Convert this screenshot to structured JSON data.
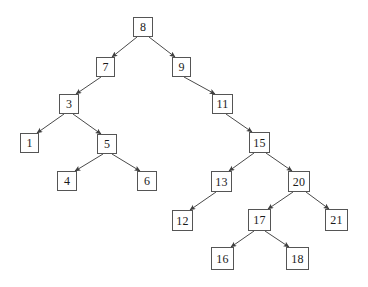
{
  "figure": {
    "type": "diagram",
    "background_color": "#ffffff",
    "node_border_color": "#555555",
    "node_fill_color": "#ffffff",
    "edge_color": "#4a4a4a",
    "text_color": "#1a1a1a"
  },
  "tree": {
    "root": "8",
    "node_count": 17,
    "nodes": [
      {
        "id": "n8",
        "label": "8",
        "x": 133,
        "y": 17,
        "w": 20,
        "h": 20,
        "level": 0
      },
      {
        "id": "n7",
        "label": "7",
        "x": 96,
        "y": 57,
        "w": 19,
        "h": 20,
        "level": 1
      },
      {
        "id": "n9",
        "label": "9",
        "x": 172,
        "y": 57,
        "w": 19,
        "h": 20,
        "level": 1
      },
      {
        "id": "n3",
        "label": "3",
        "x": 59,
        "y": 94,
        "w": 20,
        "h": 20,
        "level": 2
      },
      {
        "id": "n11",
        "label": "11",
        "x": 212,
        "y": 94,
        "w": 21,
        "h": 20,
        "level": 2
      },
      {
        "id": "n1",
        "label": "1",
        "x": 20,
        "y": 133,
        "w": 19,
        "h": 20,
        "level": 3
      },
      {
        "id": "n5",
        "label": "5",
        "x": 97,
        "y": 134,
        "w": 20,
        "h": 20,
        "level": 3
      },
      {
        "id": "n15",
        "label": "15",
        "x": 249,
        "y": 132,
        "w": 21,
        "h": 21,
        "level": 3
      },
      {
        "id": "n4",
        "label": "4",
        "x": 57,
        "y": 171,
        "w": 20,
        "h": 20,
        "level": 4
      },
      {
        "id": "n6",
        "label": "6",
        "x": 137,
        "y": 171,
        "w": 20,
        "h": 20,
        "level": 4
      },
      {
        "id": "n13",
        "label": "13",
        "x": 211,
        "y": 171,
        "w": 21,
        "h": 21,
        "level": 4
      },
      {
        "id": "n20",
        "label": "20",
        "x": 288,
        "y": 171,
        "w": 22,
        "h": 21,
        "level": 4
      },
      {
        "id": "n12",
        "label": "12",
        "x": 172,
        "y": 210,
        "w": 21,
        "h": 21,
        "level": 5
      },
      {
        "id": "n17",
        "label": "17",
        "x": 248,
        "y": 209,
        "w": 23,
        "h": 22,
        "level": 5
      },
      {
        "id": "n21",
        "label": "21",
        "x": 325,
        "y": 209,
        "w": 23,
        "h": 22,
        "level": 5
      },
      {
        "id": "n16",
        "label": "16",
        "x": 211,
        "y": 247,
        "w": 23,
        "h": 23,
        "level": 6
      },
      {
        "id": "n18",
        "label": "18",
        "x": 286,
        "y": 247,
        "w": 23,
        "h": 23,
        "level": 6
      }
    ],
    "edges": [
      {
        "from": "n8",
        "to": "n7",
        "side": "left",
        "x1": 137,
        "y1": 37,
        "x2": 112,
        "y2": 57
      },
      {
        "from": "n8",
        "to": "n9",
        "side": "right",
        "x1": 149,
        "y1": 37,
        "x2": 175,
        "y2": 57
      },
      {
        "from": "n7",
        "to": "n3",
        "side": "left",
        "x1": 101,
        "y1": 77,
        "x2": 76,
        "y2": 94
      },
      {
        "from": "n9",
        "to": "n11",
        "side": "right",
        "x1": 184,
        "y1": 77,
        "x2": 215,
        "y2": 94
      },
      {
        "from": "n3",
        "to": "n1",
        "side": "left",
        "x1": 64,
        "y1": 114,
        "x2": 37,
        "y2": 133
      },
      {
        "from": "n3",
        "to": "n5",
        "side": "right",
        "x1": 73,
        "y1": 114,
        "x2": 101,
        "y2": 134
      },
      {
        "from": "n11",
        "to": "n15",
        "side": "right",
        "x1": 226,
        "y1": 114,
        "x2": 252,
        "y2": 132
      },
      {
        "from": "n5",
        "to": "n4",
        "side": "left",
        "x1": 103,
        "y1": 154,
        "x2": 75,
        "y2": 171
      },
      {
        "from": "n5",
        "to": "n6",
        "side": "right",
        "x1": 112,
        "y1": 154,
        "x2": 140,
        "y2": 171
      },
      {
        "from": "n15",
        "to": "n13",
        "side": "left",
        "x1": 254,
        "y1": 153,
        "x2": 229,
        "y2": 171
      },
      {
        "from": "n15",
        "to": "n20",
        "side": "right",
        "x1": 266,
        "y1": 153,
        "x2": 292,
        "y2": 171
      },
      {
        "from": "n13",
        "to": "n12",
        "side": "left",
        "x1": 216,
        "y1": 192,
        "x2": 190,
        "y2": 210
      },
      {
        "from": "n20",
        "to": "n17",
        "side": "left",
        "x1": 293,
        "y1": 192,
        "x2": 268,
        "y2": 209
      },
      {
        "from": "n20",
        "to": "n21",
        "side": "right",
        "x1": 306,
        "y1": 192,
        "x2": 329,
        "y2": 209
      },
      {
        "from": "n17",
        "to": "n16",
        "side": "left",
        "x1": 254,
        "y1": 231,
        "x2": 231,
        "y2": 247
      },
      {
        "from": "n17",
        "to": "n18",
        "side": "right",
        "x1": 265,
        "y1": 231,
        "x2": 289,
        "y2": 247
      }
    ]
  }
}
